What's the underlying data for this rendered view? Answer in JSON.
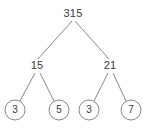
{
  "diagram": {
    "type": "factor-tree",
    "colors": {
      "background": "#ffffff",
      "stroke": "#7a7a7a",
      "text": "#3a3a3a"
    },
    "nodes": [
      {
        "id": "root",
        "label": "315",
        "x": 73,
        "y": 14,
        "level": 0,
        "shape": "plain"
      },
      {
        "id": "n15",
        "label": "15",
        "x": 37,
        "y": 66,
        "level": 1,
        "shape": "plain"
      },
      {
        "id": "n21",
        "label": "21",
        "x": 110,
        "y": 66,
        "level": 1,
        "shape": "plain"
      },
      {
        "id": "leaf3a",
        "label": "3",
        "x": 15,
        "y": 110,
        "level": 2,
        "shape": "circle",
        "radius": 10
      },
      {
        "id": "leaf5",
        "label": "5",
        "x": 59,
        "y": 110,
        "level": 2,
        "shape": "circle",
        "radius": 10
      },
      {
        "id": "leaf3b",
        "label": "3",
        "x": 89,
        "y": 110,
        "level": 2,
        "shape": "circle",
        "radius": 10
      },
      {
        "id": "leaf7",
        "label": "7",
        "x": 131,
        "y": 110,
        "level": 2,
        "shape": "circle",
        "radius": 10
      }
    ],
    "edges": [
      {
        "from": "root",
        "to": "n15",
        "x1": 72,
        "y1": 21,
        "x2": 38,
        "y2": 59
      },
      {
        "from": "root",
        "to": "n21",
        "x1": 75,
        "y1": 21,
        "x2": 109,
        "y2": 59
      },
      {
        "from": "n15",
        "to": "leaf3a",
        "x1": 35,
        "y1": 73,
        "x2": 20,
        "y2": 101
      },
      {
        "from": "n15",
        "to": "leaf5",
        "x1": 40,
        "y1": 73,
        "x2": 54,
        "y2": 101
      },
      {
        "from": "n21",
        "to": "leaf3b",
        "x1": 108,
        "y1": 73,
        "x2": 94,
        "y2": 101
      },
      {
        "from": "n21",
        "to": "leaf7",
        "x1": 113,
        "y1": 73,
        "x2": 126,
        "y2": 101
      }
    ]
  }
}
